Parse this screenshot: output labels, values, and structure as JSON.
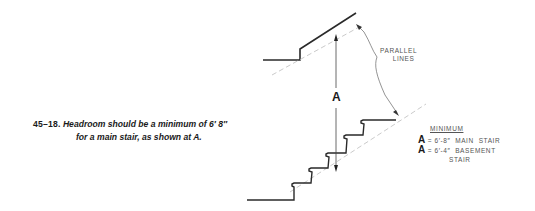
{
  "figure": {
    "number": "45–18.",
    "caption_line1": "Headroom should be a minimum of 6′ 8″",
    "caption_line2": "for a main stair, as shown at A."
  },
  "diagram": {
    "dimension_label": "A",
    "parallel_label_line1": "PARALLEL",
    "parallel_label_line2": "LINES",
    "minimum_heading": "MINIMUM",
    "entries": [
      {
        "symbol": "A",
        "value": "= 6′-8″  MAIN  STAIR"
      },
      {
        "symbol": "A",
        "value": "= 6′-4″  BASEMENT"
      },
      {
        "symbol": "",
        "value": "STAIR"
      }
    ]
  },
  "colors": {
    "line": "#2a2a2a",
    "dashed": "#bbbbbb",
    "text": "#1a1a1a",
    "label": "#555555"
  }
}
